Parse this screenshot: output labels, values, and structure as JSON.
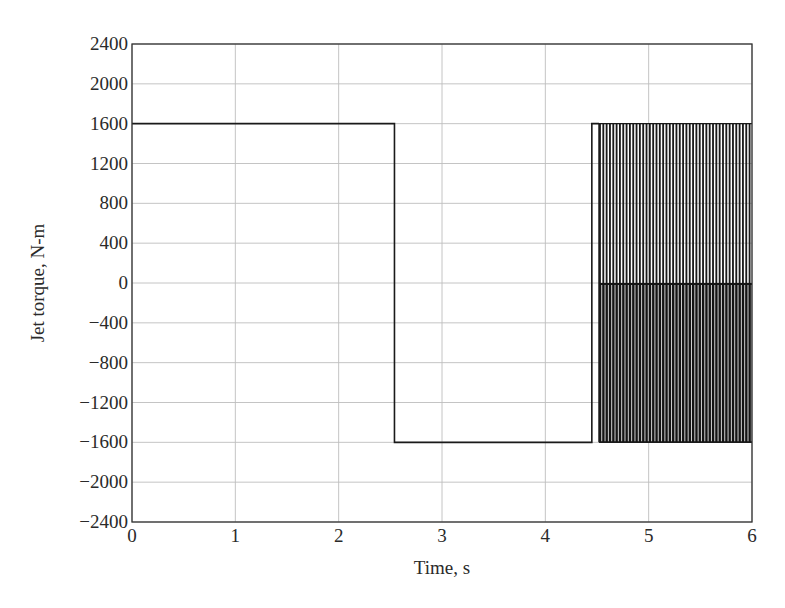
{
  "chart_data": {
    "type": "line",
    "title": "",
    "xlabel": "Time, s",
    "ylabel": "Jet torque, N-m",
    "xlim": [
      0,
      6
    ],
    "ylim": [
      -2400,
      2400
    ],
    "xticks": [
      0,
      1,
      2,
      3,
      4,
      5,
      6
    ],
    "yticks": [
      2400,
      2000,
      1600,
      1200,
      800,
      400,
      0,
      -400,
      -800,
      -1200,
      -1600,
      -2000,
      -2400
    ],
    "xtick_labels": [
      "0",
      "1",
      "2",
      "3",
      "4",
      "5",
      "6"
    ],
    "ytick_labels": [
      "2400",
      "2000",
      "1600",
      "1200",
      "800",
      "400",
      "0",
      "−400",
      "−800",
      "−1200",
      "−1600",
      "−2000",
      "−2400"
    ],
    "grid": true,
    "legend": null,
    "series": [
      {
        "name": "Jet torque",
        "color": "#1a1a1a",
        "segments": [
          {
            "t_start": 0,
            "t_end": 2.54,
            "value": 1600
          },
          {
            "t_start": 2.54,
            "t_end": 4.45,
            "value": -1600
          },
          {
            "t_start": 4.45,
            "t_end": 4.52,
            "value": 1600
          },
          {
            "t_start": 4.52,
            "t_end": 6.0,
            "behavior": "chattering",
            "values": [
              1600,
              0,
              -1600
            ],
            "note": "rapid switching between +1600, 0 and -1600 N-m"
          }
        ],
        "x": [
          0,
          2.54,
          2.54,
          4.45,
          4.45,
          4.52
        ],
        "y": [
          1600,
          1600,
          -1600,
          -1600,
          1600,
          1600
        ]
      }
    ],
    "chatter": {
      "t_start": 4.52,
      "t_end": 6.0,
      "upper": 1600,
      "mid": 0,
      "lower": -1600,
      "count": 46
    }
  }
}
